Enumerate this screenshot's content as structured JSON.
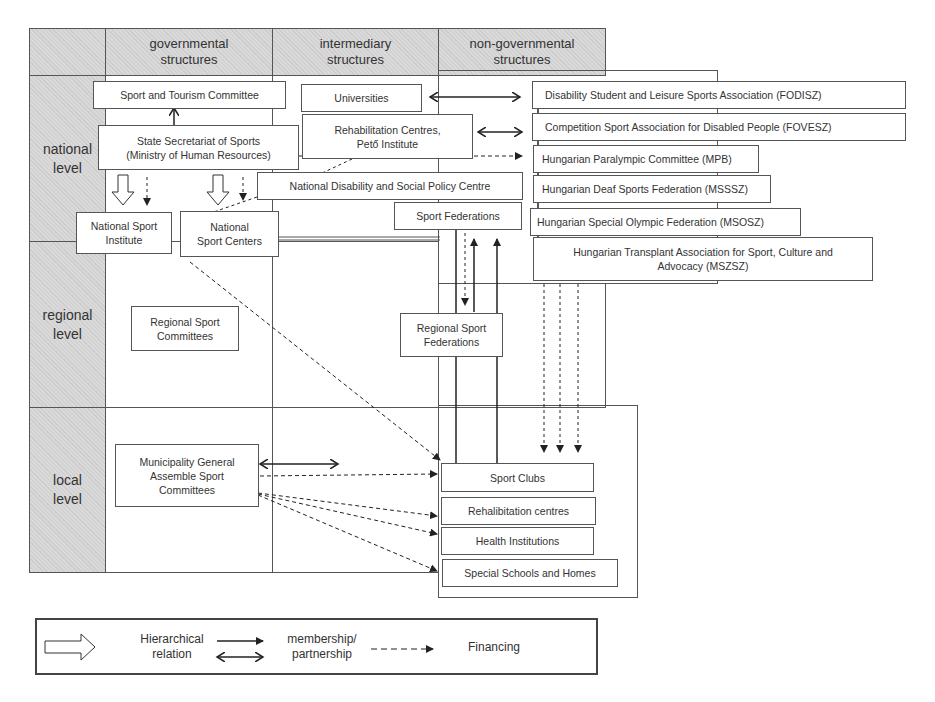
{
  "diagram": {
    "columns": [
      {
        "id": "gov",
        "label": "governmental\nstructures"
      },
      {
        "id": "inter",
        "label": "intermediary\nstructures"
      },
      {
        "id": "nongov",
        "label": "non-governmental\nstructures"
      }
    ],
    "levels": [
      {
        "id": "national",
        "label": "national\nlevel"
      },
      {
        "id": "regional",
        "label": "regional\nlevel"
      },
      {
        "id": "local",
        "label": "local\nlevel"
      }
    ],
    "nodes": {
      "sport_tourism_committee": "Sport and Tourism Committee",
      "state_secretariat": "State Secretariat of Sports\n(Ministry of Human Resources)",
      "national_sport_institute": "National Sport\nInstitute",
      "national_sport_centers": "National\nSport Centers",
      "universities": "Universities",
      "rehab_centres_peto": "Rehabilitation Centres,\nPető Institute",
      "ndspc": "National Disability and Social Policy Centre",
      "sport_federations": "Sport Federations",
      "fodisz": "Disability Student and Leisure Sports Association (FODISZ)",
      "fovesz": "Competition Sport Association for Disabled People (FOVESZ)",
      "mpb": "Hungarian Paralympic Committee (MPB)",
      "msssz": "Hungarian Deaf Sports Federation (MSSSZ)",
      "msosz": "Hungarian Special Olympic Federation (MSOSZ)",
      "mszsz": "Hungarian Transplant Association for Sport, Culture and\nAdvocacy (MSZSZ)",
      "regional_sport_committees": "Regional Sport\nCommittees",
      "regional_sport_federations": "Regional Sport\nFederations",
      "municipality": "Municipality General\nAssemble Sport\nCommittees",
      "sport_clubs": "Sport Clubs",
      "rehab_centres_local": "Rehalibitation centres",
      "health_institutions": "Health Institutions",
      "special_schools": "Special Schools and Homes"
    },
    "edges": [
      {
        "from": "sport_tourism_committee",
        "to": "state_secretariat",
        "type": "membership/partnership"
      },
      {
        "from": "state_secretariat",
        "to": "national_sport_institute",
        "type": "hierarchical"
      },
      {
        "from": "state_secretariat",
        "to": "national_sport_institute",
        "type": "financing"
      },
      {
        "from": "state_secretariat",
        "to": "national_sport_centers",
        "type": "hierarchical"
      },
      {
        "from": "state_secretariat",
        "to": "national_sport_centers",
        "type": "financing"
      },
      {
        "from": "state_secretariat",
        "to": "mpb",
        "type": "financing"
      },
      {
        "from": "ndspc",
        "to": "national_sport_centers",
        "type": "financing"
      },
      {
        "from": "universities",
        "to": "fodisz",
        "type": "membership/partnership"
      },
      {
        "from": "rehab_centres_peto",
        "to": "fovesz",
        "type": "membership/partnership"
      },
      {
        "from": "sport_federations",
        "to": "regional_sport_federations",
        "type": "financing"
      },
      {
        "from": "regional_sport_federations",
        "to": "sport_federations",
        "type": "membership"
      },
      {
        "from": "sport_clubs",
        "to": "sport_federations",
        "type": "membership"
      },
      {
        "from": "national_sport_centers",
        "to": "sport_clubs",
        "type": "financing"
      },
      {
        "from": "nongov_associations",
        "to": "sport_clubs",
        "type": "financing"
      },
      {
        "from": "municipality",
        "to": "sport_clubs",
        "type": "financing"
      },
      {
        "from": "municipality",
        "to": "rehab_centres_local",
        "type": "financing"
      },
      {
        "from": "municipality",
        "to": "health_institutions",
        "type": "financing"
      },
      {
        "from": "municipality",
        "to": "special_schools",
        "type": "financing"
      },
      {
        "from": "municipality",
        "to": "intermediary",
        "type": "membership/partnership"
      }
    ]
  },
  "legend": {
    "hierarchical": "Hierarchical\nrelation",
    "membership": "membership/\npartnership",
    "financing": "Financing"
  },
  "colors": {
    "header_fill": "#d9d9d9",
    "line": "#333333",
    "box_border": "#555555"
  }
}
